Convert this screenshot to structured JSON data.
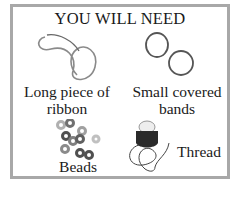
{
  "title": "YOU WILL NEED",
  "items": [
    {
      "name": "ribbon",
      "label_line1": "Long piece of",
      "label_line2": "ribbon",
      "icon": "ribbon-icon"
    },
    {
      "name": "bands",
      "label_line1": "Small covered",
      "label_line2": "bands",
      "icon": "bands-icon"
    },
    {
      "name": "beads",
      "label_line1": "Beads",
      "icon": "beads-icon"
    },
    {
      "name": "thread",
      "label_line1": "Thread",
      "icon": "thread-spool-icon"
    }
  ],
  "colors": {
    "border": "#a8a8a8",
    "text": "#1a1a1a",
    "bead_dark": "#505050",
    "bead_light": "#b8b8b8"
  }
}
